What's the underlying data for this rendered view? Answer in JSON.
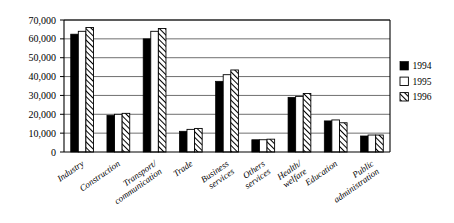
{
  "chart_data": {
    "type": "bar",
    "title": "",
    "subtitle": "",
    "xlabel": "",
    "ylabel": "",
    "ylim": [
      0,
      70000
    ],
    "ytick_labels": [
      "0",
      "10,000",
      "20,000",
      "30,000",
      "40,000",
      "50,000",
      "60,000",
      "70,000"
    ],
    "ytick_values": [
      0,
      10000,
      20000,
      30000,
      40000,
      50000,
      60000,
      70000
    ],
    "grid": "horizontal",
    "legend_position": "right",
    "categories": [
      "Industry",
      "Construction",
      "Transport/\ncommunication",
      "Trade",
      "Business\nservices",
      "Others\nservices",
      "Health/\nwelfare",
      "Education",
      "Public\nadministration"
    ],
    "series": [
      {
        "name": "1994",
        "pattern": "solid-black",
        "color": "#000000",
        "values": [
          62500,
          19500,
          60000,
          11000,
          37500,
          6500,
          29000,
          16500,
          8500
        ]
      },
      {
        "name": "1995",
        "pattern": "white-outline",
        "color": "#ffffff",
        "values": [
          64000,
          20000,
          64000,
          12000,
          41000,
          6500,
          29500,
          17000,
          9000
        ]
      },
      {
        "name": "1996",
        "pattern": "diagonal-hatch",
        "color": "#ffffff",
        "values": [
          66000,
          20500,
          65500,
          12500,
          43500,
          6800,
          31000,
          15500,
          9000
        ]
      }
    ]
  },
  "legend": {
    "items": [
      {
        "label": "1994"
      },
      {
        "label": "1995"
      },
      {
        "label": "1996"
      }
    ]
  }
}
